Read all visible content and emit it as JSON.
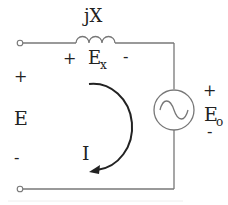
{
  "diagram": {
    "type": "circuit",
    "reactance_label": "jX",
    "reactance_voltage": {
      "base": "E",
      "sub": "x",
      "plus": "+",
      "minus": "-"
    },
    "source_voltage": {
      "label": "E",
      "plus": "+",
      "minus": "-"
    },
    "generator_voltage": {
      "base": "E",
      "sub": "o",
      "plus": "+",
      "minus": "-"
    },
    "current_label": "I",
    "colors": {
      "wire": "#777777",
      "text": "#222222",
      "arrow": "#222222"
    }
  }
}
